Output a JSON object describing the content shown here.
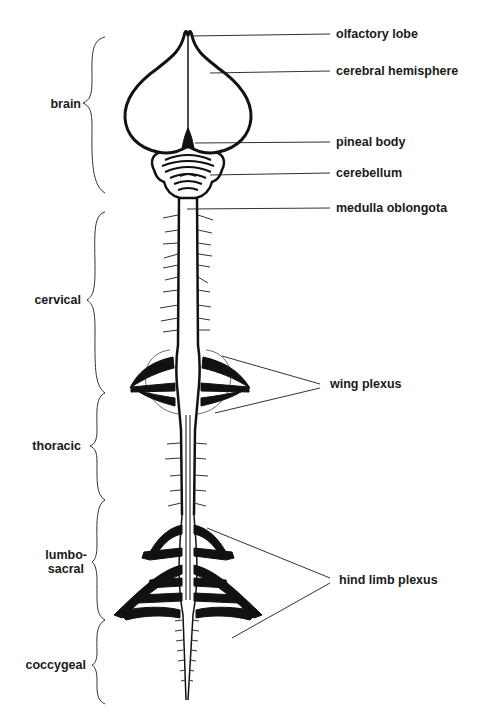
{
  "diagram": {
    "right_labels": [
      {
        "id": "olfactory-lobe",
        "text": "olfactory lobe"
      },
      {
        "id": "cerebral-hemisphere",
        "text": "cerebral hemisphere"
      },
      {
        "id": "pineal-body",
        "text": "pineal body"
      },
      {
        "id": "cerebellum",
        "text": "cerebellum"
      },
      {
        "id": "medulla-oblongota",
        "text": "medulla oblongota"
      },
      {
        "id": "wing-plexus",
        "text": "wing plexus"
      },
      {
        "id": "hind-limb-plexus",
        "text": "hind limb plexus"
      }
    ],
    "region_labels": [
      {
        "id": "brain",
        "text": "brain"
      },
      {
        "id": "cervical",
        "text": "cervical"
      },
      {
        "id": "thoracic",
        "text": "thoracic"
      },
      {
        "id": "lumbosacral-1",
        "text": "lumbo-"
      },
      {
        "id": "lumbosacral-2",
        "text": "sacral"
      },
      {
        "id": "coccygeal",
        "text": "coccygeal"
      }
    ],
    "colors": {
      "ink": "#111111",
      "background": "#ffffff"
    }
  }
}
